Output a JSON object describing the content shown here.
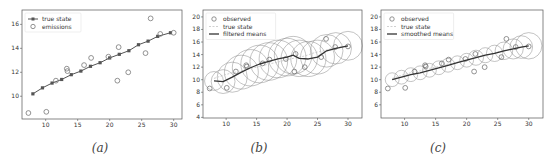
{
  "chart_data": [
    {
      "type": "line",
      "caption": "(a)",
      "title": "",
      "xlabel": "",
      "ylabel": "",
      "xlim": [
        6.3,
        31.3
      ],
      "ylim": [
        8.1,
        17.2
      ],
      "xticks": [
        10,
        15,
        20,
        25,
        30
      ],
      "yticks": [
        10,
        12,
        14,
        16
      ],
      "grid": false,
      "legend_position": "upper left",
      "series": [
        {
          "name": "true state",
          "style": "line-with-square-markers",
          "color": "#555555",
          "x": [
            8.0,
            9.5,
            11.0,
            12.5,
            14.0,
            15.5,
            17.0,
            18.5,
            20.0,
            21.5,
            23.0,
            24.5,
            26.0,
            27.5,
            29.5
          ],
          "y": [
            10.2,
            10.7,
            11.1,
            11.4,
            11.8,
            12.1,
            12.5,
            12.8,
            13.2,
            13.5,
            13.8,
            14.3,
            14.6,
            15.0,
            15.3
          ]
        },
        {
          "name": "emissions",
          "style": "hollow-circles",
          "color": "#777777",
          "x": [
            7.3,
            10.1,
            11.6,
            13.3,
            13.4,
            16.0,
            17.1,
            19.8,
            21.2,
            21.4,
            22.9,
            25.6,
            26.4,
            27.9,
            30.0
          ],
          "y": [
            8.6,
            8.7,
            11.3,
            12.3,
            12.1,
            12.6,
            13.2,
            13.3,
            11.3,
            14.1,
            12.0,
            13.6,
            16.5,
            15.2,
            15.3
          ]
        }
      ]
    },
    {
      "type": "line",
      "caption": "(b)",
      "title": "",
      "xlabel": "",
      "ylabel": "",
      "xlim": [
        6.2,
        32.3
      ],
      "ylim": [
        3.9,
        21.1
      ],
      "xticks": [
        10,
        15,
        20,
        25,
        30
      ],
      "yticks": [
        4,
        6,
        8,
        10,
        12,
        14,
        16,
        18,
        20
      ],
      "grid": false,
      "legend_position": "upper left",
      "series": [
        {
          "name": "observed",
          "style": "hollow-circles",
          "color": "#777777",
          "x": [
            7.3,
            10.1,
            11.6,
            13.3,
            13.4,
            16.0,
            17.1,
            19.8,
            21.2,
            21.4,
            22.9,
            25.6,
            26.4,
            27.9,
            30.0
          ],
          "y": [
            8.6,
            8.7,
            11.3,
            12.3,
            12.1,
            12.6,
            13.2,
            13.3,
            11.3,
            14.1,
            12.0,
            13.6,
            16.5,
            15.2,
            15.3
          ]
        },
        {
          "name": "true state",
          "style": "dashed-line",
          "color": "#bbbbbb",
          "x": [
            8.0,
            9.5,
            11.0,
            12.5,
            14.0,
            15.5,
            17.0,
            18.5,
            20.0,
            21.5,
            23.0,
            24.5,
            26.0,
            27.5,
            29.5
          ],
          "y": [
            10.2,
            10.7,
            11.1,
            11.4,
            11.8,
            12.1,
            12.5,
            12.8,
            13.2,
            13.5,
            13.8,
            14.3,
            14.6,
            15.0,
            15.3
          ]
        },
        {
          "name": "filtered means",
          "style": "solid-line",
          "color": "#333333",
          "x": [
            8.0,
            9.5,
            11.0,
            12.5,
            14.0,
            15.5,
            17.0,
            18.5,
            20.0,
            21.0,
            22.0,
            23.5,
            25.0,
            26.5,
            28.0,
            30.0
          ],
          "y": [
            9.8,
            9.7,
            10.4,
            11.2,
            11.9,
            12.5,
            12.9,
            13.3,
            13.6,
            13.9,
            13.4,
            13.3,
            13.6,
            14.6,
            15.0,
            15.4
          ],
          "uncertainty_radius": [
            1.5,
            1.9,
            2.4,
            2.7,
            2.9,
            3.0,
            3.0,
            3.0,
            3.0,
            3.0,
            2.9,
            2.8,
            2.7,
            2.6,
            2.5,
            2.3
          ]
        }
      ]
    },
    {
      "type": "line",
      "caption": "(c)",
      "title": "",
      "xlabel": "",
      "ylabel": "",
      "xlim": [
        6.2,
        32.3
      ],
      "ylim": [
        3.9,
        21.1
      ],
      "xticks": [
        10,
        15,
        20,
        25,
        30
      ],
      "yticks": [
        6,
        8,
        10,
        12,
        14,
        16,
        18,
        20
      ],
      "grid": false,
      "legend_position": "upper left",
      "series": [
        {
          "name": "observed",
          "style": "hollow-circles",
          "color": "#777777",
          "x": [
            7.3,
            10.1,
            11.6,
            13.3,
            13.4,
            16.0,
            17.1,
            19.8,
            21.2,
            21.4,
            22.9,
            25.6,
            26.4,
            27.9,
            30.0
          ],
          "y": [
            8.6,
            8.7,
            11.3,
            12.3,
            12.1,
            12.6,
            13.2,
            13.3,
            11.3,
            14.1,
            12.0,
            13.6,
            16.5,
            15.2,
            15.3
          ]
        },
        {
          "name": "true state",
          "style": "dashed-line",
          "color": "#bbbbbb",
          "x": [
            8.0,
            9.5,
            11.0,
            12.5,
            14.0,
            15.5,
            17.0,
            18.5,
            20.0,
            21.5,
            23.0,
            24.5,
            26.0,
            27.5,
            29.5
          ],
          "y": [
            10.2,
            10.7,
            11.1,
            11.4,
            11.8,
            12.1,
            12.5,
            12.8,
            13.2,
            13.5,
            13.8,
            14.3,
            14.6,
            15.0,
            15.3
          ]
        },
        {
          "name": "smoothed means",
          "style": "solid-line",
          "color": "#333333",
          "x": [
            8.0,
            9.5,
            11.0,
            12.5,
            14.0,
            15.5,
            17.0,
            18.5,
            20.0,
            21.5,
            23.0,
            24.5,
            26.0,
            27.5,
            28.8,
            30.0
          ],
          "y": [
            10.0,
            10.4,
            10.8,
            11.1,
            11.5,
            11.9,
            12.3,
            12.7,
            13.1,
            13.5,
            13.9,
            14.2,
            14.6,
            14.9,
            15.2,
            15.4
          ],
          "uncertainty_radius": [
            1.1,
            1.1,
            1.1,
            1.1,
            1.1,
            1.1,
            1.1,
            1.1,
            1.1,
            1.2,
            1.2,
            1.3,
            1.4,
            1.6,
            1.8,
            2.1
          ]
        }
      ]
    }
  ],
  "panels": [
    {
      "caption": "(a)",
      "legend": [
        "true state",
        "emissions"
      ]
    },
    {
      "caption": "(b)",
      "legend": [
        "observed",
        "true state",
        "filtered means"
      ]
    },
    {
      "caption": "(c)",
      "legend": [
        "observed",
        "true state",
        "smoothed means"
      ]
    }
  ]
}
